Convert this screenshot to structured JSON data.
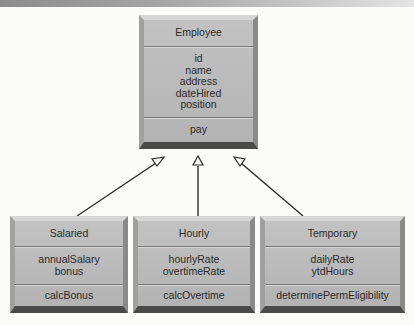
{
  "diagram": {
    "type": "uml-class-inheritance",
    "parent": {
      "name": "Employee",
      "attributes": [
        "id",
        "name",
        "address",
        "dateHired",
        "position"
      ],
      "methods": [
        "pay"
      ]
    },
    "children": [
      {
        "name": "Salaried",
        "attributes": [
          "annualSalary",
          "bonus"
        ],
        "methods": [
          "calcBonus"
        ]
      },
      {
        "name": "Hourly",
        "attributes": [
          "hourlyRate",
          "overtimeRate"
        ],
        "methods": [
          "calcOvertime"
        ]
      },
      {
        "name": "Temporary",
        "attributes": [
          "dailyRate",
          "ytdHours"
        ],
        "methods": [
          "determinePermEligibility"
        ]
      }
    ],
    "relationship": "generalization",
    "colors": {
      "box_fill": "#b8b8b8",
      "line": "#2a2a2a",
      "text": "#2a2a2a"
    }
  }
}
